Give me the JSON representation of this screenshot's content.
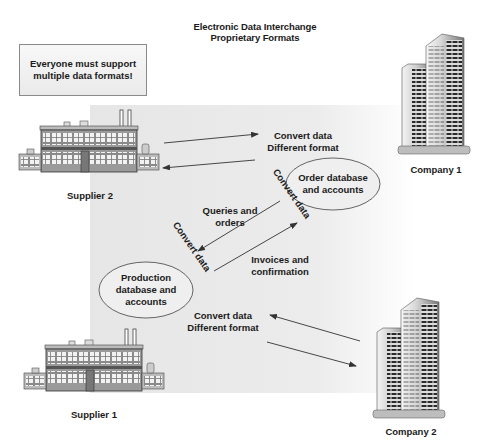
{
  "title": {
    "line1": "Electronic Data Interchange",
    "line2": "Proprietary Formats"
  },
  "callout": {
    "line1": "Everyone must support",
    "line2": "multiple data formats!"
  },
  "entities": {
    "supplier2": {
      "label": "Supplier 2",
      "icon": "factory-icon"
    },
    "supplier1": {
      "label": "Supplier 1",
      "icon": "factory-icon"
    },
    "company1": {
      "label": "Company 1",
      "icon": "office-building-icon"
    },
    "company2": {
      "label": "Company 2",
      "icon": "office-building-icon"
    }
  },
  "databases": {
    "order": {
      "line1": "Order database",
      "line2": "and accounts"
    },
    "production": {
      "line1": "Production",
      "line2": "database and",
      "line3": "accounts"
    }
  },
  "flows": {
    "top": {
      "line1": "Convert data",
      "line2": "Different format"
    },
    "bottom": {
      "line1": "Convert data",
      "line2": "Different format"
    },
    "queries": {
      "line1": "Queries and",
      "line2": "orders"
    },
    "invoices": {
      "line1": "Invoices and",
      "line2": "confirmation"
    },
    "convert_upper": "Convert data",
    "convert_lower": "Convert data"
  },
  "colors": {
    "panel": "#e8e8e8",
    "text": "#1a1a1a",
    "arrow": "#333333",
    "callout_border": "#8a8a8a"
  }
}
